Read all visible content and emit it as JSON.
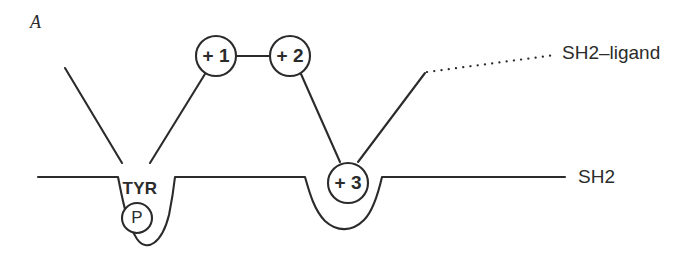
{
  "figure": {
    "panel_label": "A",
    "stroke_color": "#2b2b2b",
    "background_color": "#ffffff"
  },
  "nodes": [
    {
      "id": "plus1",
      "label": "+ 1",
      "cx": 216,
      "cy": 56,
      "r": 20
    },
    {
      "id": "plus2",
      "label": "+ 2",
      "cx": 290,
      "cy": 56,
      "r": 20
    },
    {
      "id": "plus3",
      "label": "+ 3",
      "cx": 348,
      "cy": 183,
      "r": 20
    },
    {
      "id": "phosphate",
      "label": "P",
      "cx": 137,
      "cy": 218,
      "r": 15
    }
  ],
  "pocket_labels": {
    "tyr": "TYR"
  },
  "side_labels": {
    "ligand": "SH2–ligand",
    "domain": "SH2"
  }
}
